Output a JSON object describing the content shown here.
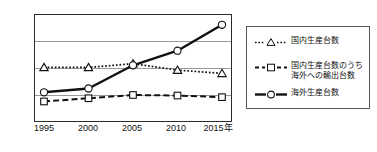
{
  "chart_data": {
    "type": "line",
    "title": "",
    "xlabel": "",
    "ylabel": "万台",
    "y_unit": "万台",
    "ylim": [
      0,
      2000
    ],
    "yticks": [
      0,
      500,
      1000,
      1500,
      2000
    ],
    "ytick_labels": [
      "0",
      "500",
      "1000",
      "1500",
      "2000"
    ],
    "categories": [
      1995,
      2000,
      2005,
      2010,
      2015
    ],
    "xtick_labels": [
      "1995",
      "2000",
      "2005",
      "2010",
      "2015年"
    ],
    "grid": true,
    "legend_position": "right",
    "series": [
      {
        "name": "国内生産台数",
        "marker": "triangle",
        "line_style": "dotted",
        "values": [
          1010,
          1010,
          1080,
          960,
          900
        ]
      },
      {
        "name": "国内生産台数のうち\n海外への輸出台数",
        "marker": "square",
        "line_style": "dashed",
        "values": [
          380,
          440,
          500,
          490,
          460
        ]
      },
      {
        "name": "海外生産台数",
        "marker": "circle",
        "line_style": "solid",
        "values": [
          550,
          620,
          1050,
          1320,
          1800
        ]
      }
    ]
  },
  "colors": {
    "line": "#111111",
    "grid": "#9a9a9a",
    "frame": "#2b2b2b",
    "background": "#ffffff",
    "marker_fill": "#ffffff"
  },
  "legend": {
    "items": [
      {
        "label": "国内生産台数"
      },
      {
        "label": "国内生産台数のうち\n海外への輸出台数"
      },
      {
        "label": "海外生産台数"
      }
    ]
  }
}
